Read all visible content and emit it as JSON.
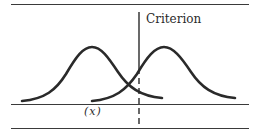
{
  "diagram": {
    "criterion_label": "Criterion",
    "axis_label": "(x)",
    "colors": {
      "stroke": "#2a2a2a",
      "background": "#ffffff"
    },
    "distributions": [
      {
        "name": "left-distribution",
        "peak_x": 92
      },
      {
        "name": "right-distribution",
        "peak_x": 164
      }
    ],
    "criterion_x": 139
  }
}
